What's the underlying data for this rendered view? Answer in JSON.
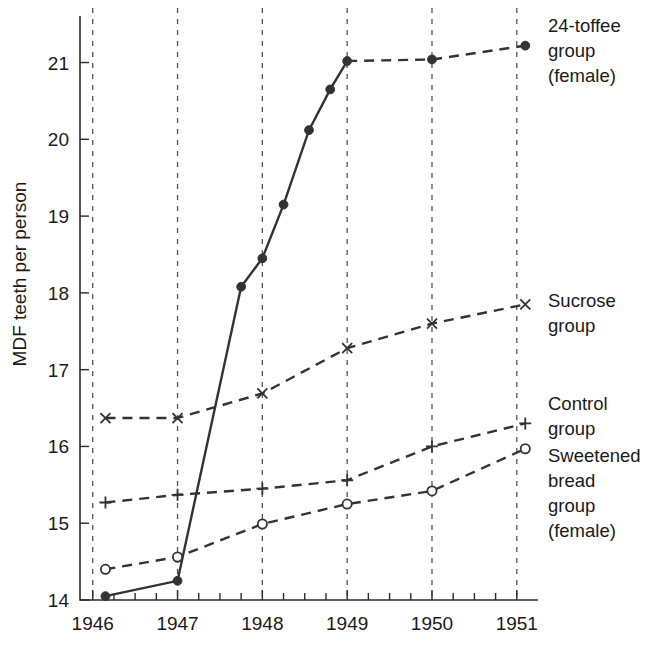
{
  "chart_data": {
    "type": "line",
    "title": "",
    "xlabel": "",
    "ylabel": "MDF teeth per person",
    "xlim": [
      1945.85,
      1951.25
    ],
    "ylim": [
      14,
      21.45
    ],
    "xticks": [
      1946,
      1947,
      1948,
      1949,
      1950,
      1951
    ],
    "xticklabels": [
      "1946",
      "1947",
      "1948",
      "1949",
      "1950",
      "1951"
    ],
    "yticks": [
      14,
      15,
      16,
      17,
      18,
      19,
      20,
      21
    ],
    "yticklabels": [
      "14",
      "15",
      "16",
      "17",
      "18",
      "19",
      "20",
      "21"
    ],
    "grid": "vertical-dashed-at-year-ticks",
    "minor_xticks_per_year": 3,
    "legend_position": "right-of-plot-at-series-end",
    "series": [
      {
        "name": "24-toffee group (female)",
        "label_lines": [
          "24-toffee",
          "group",
          "(female)"
        ],
        "marker": "filled-circle",
        "linestyle_segments": "solid-until-1949-then-dashed",
        "x": [
          1946.15,
          1947.0,
          1947.75,
          1948.0,
          1948.25,
          1948.55,
          1948.8,
          1949.0,
          1950.0,
          1951.1
        ],
        "y": [
          14.05,
          14.25,
          18.08,
          18.45,
          19.15,
          20.12,
          20.65,
          21.02,
          21.04,
          21.22
        ]
      },
      {
        "name": "Sucrose group",
        "label_lines": [
          "Sucrose",
          "group"
        ],
        "marker": "cross",
        "linestyle_segments": "dashed",
        "x": [
          1946.15,
          1947.0,
          1948.0,
          1949.0,
          1950.0,
          1951.1
        ],
        "y": [
          16.37,
          16.37,
          16.69,
          17.28,
          17.6,
          17.85
        ]
      },
      {
        "name": "Control group",
        "label_lines": [
          "Control",
          "group"
        ],
        "marker": "plus",
        "linestyle_segments": "dashed",
        "x": [
          1946.15,
          1947.0,
          1948.0,
          1949.0,
          1950.0,
          1951.1
        ],
        "y": [
          15.27,
          15.37,
          15.45,
          15.56,
          16.0,
          16.3
        ]
      },
      {
        "name": "Sweetened bread group (female)",
        "label_lines": [
          "Sweetened",
          "bread",
          "group",
          "(female)"
        ],
        "marker": "open-circle",
        "linestyle_segments": "dashed",
        "x": [
          1946.15,
          1947.0,
          1948.0,
          1949.0,
          1950.0,
          1951.1
        ],
        "y": [
          14.4,
          14.56,
          14.99,
          15.25,
          15.42,
          15.97
        ]
      }
    ]
  },
  "colors": {
    "ink": "#333333",
    "grid": "#555555",
    "background": "#ffffff"
  }
}
